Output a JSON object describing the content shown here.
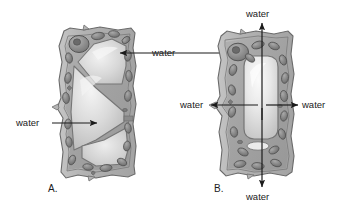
{
  "figure": {
    "background": "#ffffff",
    "panels": [
      {
        "id": "A",
        "label": "A.",
        "caption_x": 48,
        "caption_y": 188,
        "description": "plasmolyzed plant cell with shrunken protoplast",
        "labels": [
          {
            "text": "water",
            "x": 152,
            "y": 54,
            "align": "left"
          },
          {
            "text": "water",
            "x": 16,
            "y": 119,
            "align": "left"
          }
        ]
      },
      {
        "id": "B",
        "label": "B.",
        "caption_x": 216,
        "caption_y": 187,
        "description": "turgid plant cell with central vacuole and water moving outward in four directions",
        "labels": [
          {
            "text": "water",
            "x": 256,
            "y": 13,
            "align": "left"
          },
          {
            "text": "water",
            "x": 181,
            "y": 101,
            "align": "left"
          },
          {
            "text": "water",
            "x": 303,
            "y": 101,
            "align": "left"
          },
          {
            "text": "water",
            "x": 256,
            "y": 194,
            "align": "left"
          }
        ]
      }
    ],
    "colors": {
      "cell_wall": "#b9b9b9",
      "cell_wall_stroke": "#6f6f6f",
      "cytoplasm": "#a6a6a6",
      "vacuole_light": "#efefef",
      "vacuole_mid": "#cfcfcf",
      "organelle": "#8a8a8a",
      "organelle_stroke": "#4d4d4d",
      "nucleus": "#939393",
      "arrow": "#1b1b1b",
      "text": "#1b1b1b"
    },
    "arrows": {
      "a_top": {
        "from_x": 230,
        "from_y": 53,
        "to_x": 118,
        "to_y": 53
      },
      "a_mid": {
        "from_x": 52,
        "from_y": 123,
        "to_x": 98,
        "to_y": 123
      },
      "b_up": {
        "from_x": 262,
        "from_y": 118,
        "to_x": 262,
        "to_y": 22
      },
      "b_down": {
        "from_x": 262,
        "from_y": 110,
        "to_x": 262,
        "to_y": 188
      },
      "b_left": {
        "from_x": 255,
        "from_y": 105,
        "to_x": 210,
        "to_y": 105
      },
      "b_right": {
        "from_x": 268,
        "from_y": 105,
        "to_x": 297,
        "to_y": 105
      }
    }
  }
}
